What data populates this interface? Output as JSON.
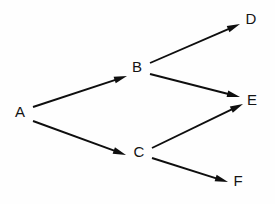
{
  "diagram": {
    "type": "directed-acyclic-graph",
    "title": "",
    "background_color": "#fefefe",
    "line_color": "#0e0e0e",
    "label_color": "#141414",
    "nodes": [
      {
        "id": "A",
        "label": "A",
        "x": 20,
        "y": 113
      },
      {
        "id": "B",
        "label": "B",
        "x": 137,
        "y": 68
      },
      {
        "id": "C",
        "label": "C",
        "x": 139,
        "y": 153
      },
      {
        "id": "D",
        "label": "D",
        "x": 251,
        "y": 20
      },
      {
        "id": "E",
        "label": "E",
        "x": 252,
        "y": 101
      },
      {
        "id": "F",
        "label": "F",
        "x": 238,
        "y": 182
      }
    ],
    "edges": [
      {
        "id": "A-B",
        "from": "A",
        "to": "B",
        "x1": 33,
        "y1": 107,
        "x2": 127,
        "y2": 76,
        "directed": true
      },
      {
        "id": "A-C",
        "from": "A",
        "to": "C",
        "x1": 33,
        "y1": 121,
        "x2": 126,
        "y2": 155,
        "directed": true
      },
      {
        "id": "B-D",
        "from": "B",
        "to": "D",
        "x1": 150,
        "y1": 63,
        "x2": 240,
        "y2": 24,
        "directed": true
      },
      {
        "id": "B-E",
        "from": "B",
        "to": "E",
        "x1": 150,
        "y1": 74,
        "x2": 240,
        "y2": 97,
        "directed": true
      },
      {
        "id": "C-E",
        "from": "C",
        "to": "E",
        "x1": 152,
        "y1": 148,
        "x2": 243,
        "y2": 104,
        "directed": true
      },
      {
        "id": "C-F",
        "from": "C",
        "to": "F",
        "x1": 152,
        "y1": 158,
        "x2": 228,
        "y2": 182,
        "directed": true
      }
    ]
  }
}
